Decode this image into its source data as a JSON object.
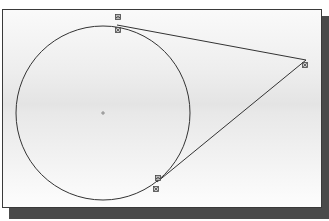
{
  "diagram": {
    "type": "cad-sketch",
    "colors": {
      "canvas_top": "#fafafa",
      "canvas_mid": "#e4e4e4",
      "frame": "#3a3a3a",
      "shadow": "#4a4a4a",
      "stroke": "#333333"
    },
    "circle": {
      "cx": 103,
      "cy": 113,
      "r": 87
    },
    "center_marker": {
      "x": 103,
      "y": 113,
      "symbol": "+"
    },
    "lines": [
      {
        "name": "upper-tangent-line",
        "x1": 117,
        "y1": 25,
        "x2": 306,
        "y2": 60
      },
      {
        "name": "lower-tangent-line",
        "x1": 306,
        "y1": 60,
        "x2": 157,
        "y2": 182
      }
    ],
    "constraint_glyphs": [
      {
        "name": "tangent-constraint-icon",
        "x": 115,
        "y": 14
      },
      {
        "name": "coincident-constraint-icon",
        "x": 115,
        "y": 27
      },
      {
        "name": "coincident-constraint-icon",
        "x": 302,
        "y": 62
      },
      {
        "name": "tangent-constraint-icon",
        "x": 155,
        "y": 175
      },
      {
        "name": "coincident-constraint-icon",
        "x": 153,
        "y": 186
      }
    ]
  }
}
